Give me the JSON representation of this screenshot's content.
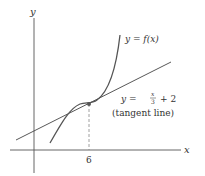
{
  "diagram": {
    "axes": {
      "x_label": "x",
      "y_label": "y"
    },
    "curve": {
      "label": "y = f(x)"
    },
    "tangent": {
      "label_prefix": "y =",
      "frac_num": "x",
      "frac_den": "3",
      "label_suffix": "+ 2",
      "note": "(tangent line)"
    },
    "point": {
      "x_tick": "6"
    },
    "colors": {
      "axis": "#555555",
      "curve": "#555555",
      "tangent": "#444444",
      "dashed": "#888888"
    }
  }
}
